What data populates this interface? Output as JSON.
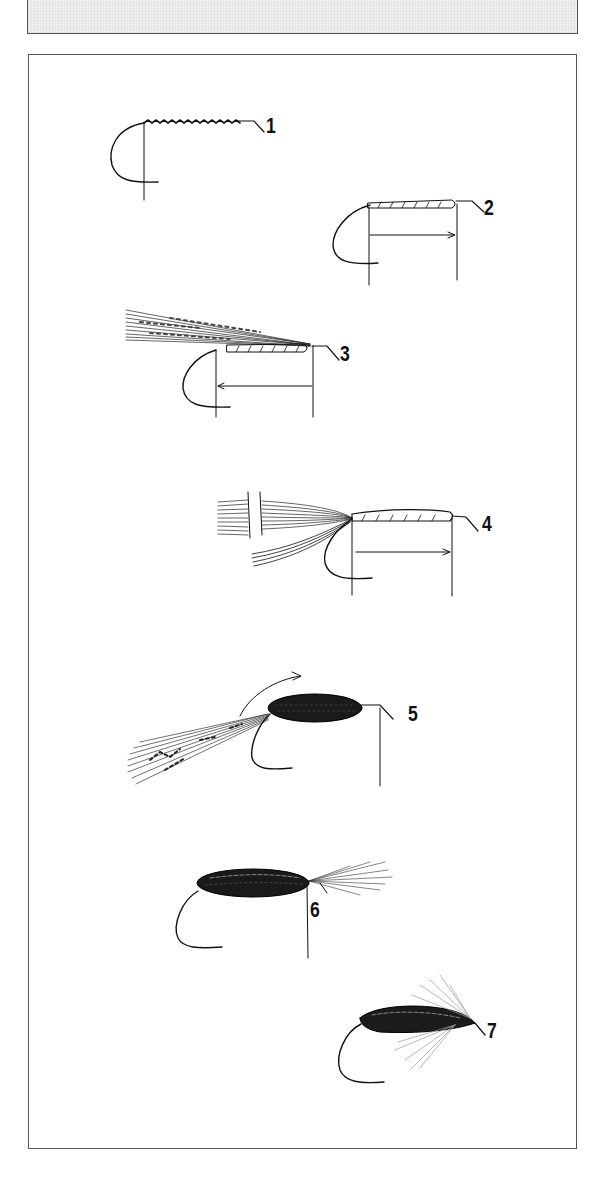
{
  "figure": {
    "title_fragment": "",
    "steps": [
      {
        "number": "1",
        "label_x": 266,
        "label_y": 115
      },
      {
        "number": "2",
        "label_x": 484,
        "label_y": 197
      },
      {
        "number": "3",
        "label_x": 340,
        "label_y": 343
      },
      {
        "number": "4",
        "label_x": 482,
        "label_y": 513
      },
      {
        "number": "5",
        "label_x": 408,
        "label_y": 703
      },
      {
        "number": "6",
        "label_x": 310,
        "label_y": 899
      },
      {
        "number": "7",
        "label_x": 487,
        "label_y": 1020
      }
    ]
  }
}
